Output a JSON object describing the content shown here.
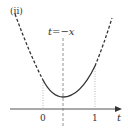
{
  "figure": {
    "panel_label": "(ii)",
    "axis_of_symmetry_label": "t=−x",
    "x_axis_label": "t",
    "ticks": [
      "0",
      "1"
    ]
  },
  "colors": {
    "curve": "#333333",
    "axis": "#555555",
    "guide": "#888888",
    "background": "#ffffff"
  }
}
